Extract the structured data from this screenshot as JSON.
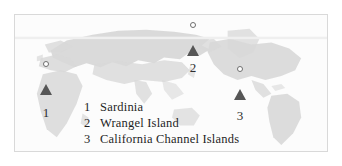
{
  "figure": {
    "type": "world-map",
    "projection": "equirectangular",
    "frame_border_color": "#d9d9d9",
    "land_color": "#d7d7d7",
    "ocean_color": "#fcfcfc",
    "arrow_color": "#565656",
    "marker_dot_color": "#ffffff"
  },
  "markers": [
    {
      "number": "1",
      "location": "Sardinia"
    },
    {
      "number": "2",
      "location": "Wrangel Island"
    },
    {
      "number": "3",
      "location": "California Channel Islands"
    }
  ],
  "legend": {
    "rows": [
      {
        "number": "1",
        "label": "Sardinia"
      },
      {
        "number": "2",
        "label": "Wrangel Island"
      },
      {
        "number": "3",
        "label": "California Channel Islands"
      }
    ]
  }
}
